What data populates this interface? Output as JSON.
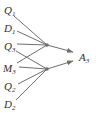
{
  "diagram": {
    "colors": {
      "background": "#ffffff",
      "line": "#6e6e6e",
      "text": "#2f2f2f"
    },
    "font": {
      "base_size": 11,
      "sub_size": 7,
      "sub_dy": 2
    },
    "nodes": [
      {
        "id": "Q1",
        "base": "Q",
        "sub": "1",
        "x": 4,
        "y": 14
      },
      {
        "id": "D1",
        "base": "D",
        "sub": "1",
        "x": 4,
        "y": 32
      },
      {
        "id": "Q3",
        "base": "Q",
        "sub": "3",
        "x": 4,
        "y": 50
      },
      {
        "id": "M3",
        "base": "M",
        "sub": "3",
        "x": 3,
        "y": 72
      },
      {
        "id": "Q2",
        "base": "Q",
        "sub": "2",
        "x": 4,
        "y": 90
      },
      {
        "id": "D2",
        "base": "D",
        "sub": "2",
        "x": 4,
        "y": 108
      }
    ],
    "target": {
      "id": "A3",
      "base": "A",
      "sub": "3",
      "x": 79,
      "y": 61
    },
    "hubs": [
      {
        "id": "hub-1",
        "x": 47,
        "y": 45,
        "r": 1.8
      },
      {
        "id": "hub-2",
        "x": 47,
        "y": 69,
        "r": 1.8
      }
    ],
    "edges": [
      {
        "from": "Q1",
        "to": "hub-1",
        "x1": 14,
        "y1": 16,
        "x2": 47,
        "y2": 45
      },
      {
        "from": "D1",
        "to": "hub-1",
        "x1": 17,
        "y1": 31,
        "x2": 47,
        "y2": 45
      },
      {
        "from": "Q3",
        "to": "hub-1",
        "x1": 17,
        "y1": 44,
        "x2": 47,
        "y2": 45
      },
      {
        "from": "Q3",
        "to": "hub-2",
        "x1": 16,
        "y1": 51,
        "x2": 47,
        "y2": 69
      },
      {
        "from": "M3",
        "to": "hub-1",
        "x1": 17,
        "y1": 63,
        "x2": 47,
        "y2": 45
      },
      {
        "from": "M3",
        "to": "hub-2",
        "x1": 19,
        "y1": 67,
        "x2": 47,
        "y2": 69
      },
      {
        "from": "Q2",
        "to": "hub-2",
        "x1": 18,
        "y1": 84,
        "x2": 47,
        "y2": 69
      },
      {
        "from": "D2",
        "to": "hub-2",
        "x1": 16,
        "y1": 100,
        "x2": 47,
        "y2": 69
      }
    ],
    "arrows": [
      {
        "from": "hub-1",
        "to": "A3",
        "x1": 47,
        "y1": 45,
        "x2": 73,
        "y2": 52
      },
      {
        "from": "hub-2",
        "to": "A3",
        "x1": 47,
        "y1": 69,
        "x2": 73,
        "y2": 61
      }
    ]
  }
}
